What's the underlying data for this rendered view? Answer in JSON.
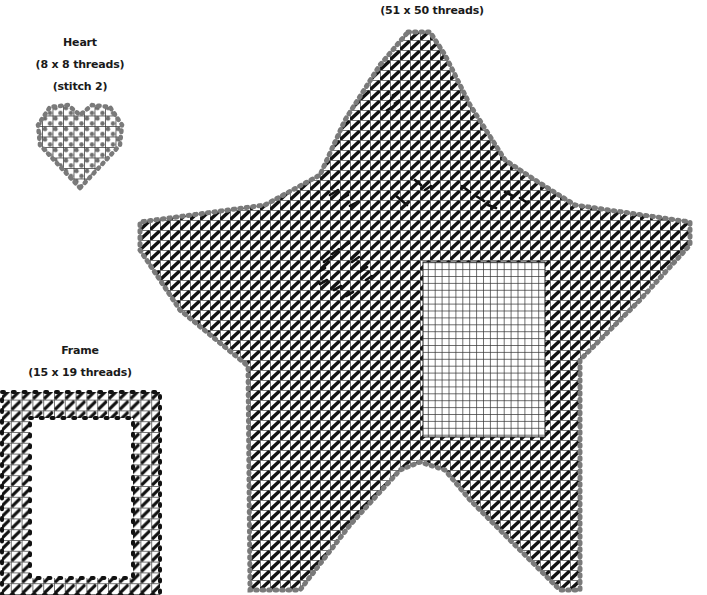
{
  "diagram": {
    "type": "plastic canvas needlepoint chart",
    "pieces": [
      {
        "id": "star",
        "name": "Star",
        "dimensions_label": "(51 x 50 threads)",
        "threads_wide": 51,
        "threads_high": 50,
        "fill_stitch": "slanted continental, black",
        "overcast_edge": "gray",
        "unworked_area": "rectangular photo window (blank grid)",
        "embroidered_details": [
          "eye cluster near top",
          "stitched smile / face lines",
          "cheek motif"
        ]
      },
      {
        "id": "heart",
        "name": "Heart",
        "title_label": "Heart",
        "dimensions_label": "(8 x 8 threads)",
        "stitch_label": "(stitch 2)",
        "threads_wide": 8,
        "threads_high": 8,
        "fill_stitch": "gray cross stitch",
        "quantity": 2
      },
      {
        "id": "frame",
        "name": "Frame",
        "title_label": "Frame",
        "dimensions_label": "(15 x 19 threads)",
        "threads_wide": 15,
        "threads_high": 19,
        "fill_stitch": "slanted continental, black",
        "overcast_edge": "black"
      }
    ],
    "colors": {
      "stitch_black": "#111111",
      "overcast_gray": "#7a7a7a",
      "grid_line": "#3a3a3a",
      "background": "#ffffff"
    }
  }
}
